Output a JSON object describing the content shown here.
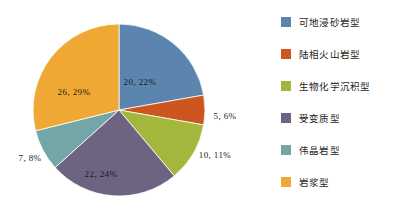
{
  "chart_data": {
    "type": "pie",
    "title": "",
    "legend_position": "right",
    "total": 70,
    "categories": [
      "可地浸砂岩型",
      "陆相火山岩型",
      "生物化学沉积型",
      "受变质型",
      "伟晶岩型",
      "岩浆型"
    ],
    "values": [
      20,
      5,
      10,
      22,
      7,
      26
    ],
    "percentages": [
      22,
      6,
      11,
      24,
      8,
      29
    ],
    "colors": [
      "#5b84ae",
      "#cc5520",
      "#a2b73c",
      "#6f6382",
      "#73a6a6",
      "#efa833"
    ],
    "data_labels": [
      "20, 22%",
      "5, 6%",
      "10, 11%",
      "22, 24%",
      "7, 8%",
      "26, 29%"
    ],
    "slices": [
      {
        "name": "可地浸砂岩型",
        "value": 20,
        "percent": 22,
        "color": "#5b84ae",
        "label": "20, 22%",
        "label_x": 140,
        "label_y": 82
      },
      {
        "name": "陆相火山岩型",
        "value": 5,
        "percent": 6,
        "color": "#cc5520",
        "label": "5, 6%",
        "label_x": 225,
        "label_y": 116
      },
      {
        "name": "生物化学沉积型",
        "value": 10,
        "percent": 11,
        "color": "#a2b73c",
        "label": "10, 11%",
        "label_x": 215,
        "label_y": 155
      },
      {
        "name": "受变质型",
        "value": 22,
        "percent": 24,
        "color": "#6f6382",
        "label": "22, 24%",
        "label_x": 101,
        "label_y": 174
      },
      {
        "name": "伟晶岩型",
        "value": 7,
        "percent": 8,
        "color": "#73a6a6",
        "label": "7, 8%",
        "label_x": 30,
        "label_y": 158
      },
      {
        "name": "岩浆型",
        "value": 26,
        "percent": 29,
        "color": "#efa833",
        "label": "26, 29%",
        "label_x": 74,
        "label_y": 92
      }
    ]
  },
  "legend": {
    "items": [
      {
        "label": "可地浸砂岩型",
        "color": "#5b84ae"
      },
      {
        "label": "陆相火山岩型",
        "color": "#cc5520"
      },
      {
        "label": "生物化学沉积型",
        "color": "#a2b73c"
      },
      {
        "label": "受变质型",
        "color": "#6f6382"
      },
      {
        "label": "伟晶岩型",
        "color": "#73a6a6"
      },
      {
        "label": "岩浆型",
        "color": "#efa833"
      }
    ]
  }
}
